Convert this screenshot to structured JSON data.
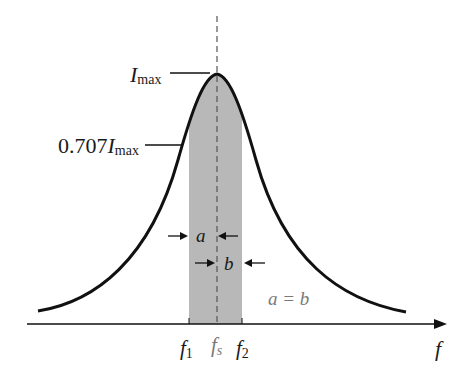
{
  "diagram": {
    "labels": {
      "i_max_main": "I",
      "i_max_sub": "max",
      "half_power_prefix": "0.707",
      "half_power_main": "I",
      "half_power_sub": "max",
      "a": "a",
      "b": "b",
      "equality": "a = b",
      "f1_main": "f",
      "f1_sub": "1",
      "fs_main": "f",
      "fs_sub": "s",
      "f2_main": "f",
      "f2_sub": "2",
      "x_axis": "f"
    },
    "colors": {
      "curve": "#111111",
      "band_fill": "#b8b8b8",
      "axis": "#111111",
      "dashed_line": "#555555",
      "equality_text": "#7a7a7a"
    }
  }
}
